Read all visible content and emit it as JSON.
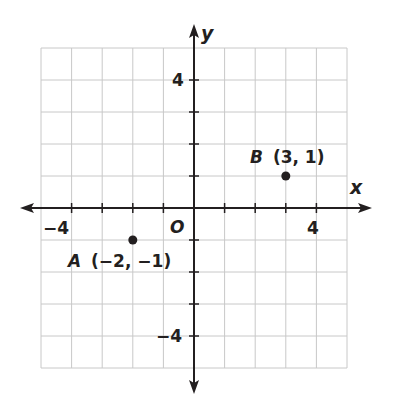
{
  "chart_data": {
    "type": "scatter",
    "title": "",
    "xlabel": "x",
    "ylabel": "y",
    "origin_label": "O",
    "xlim": [
      -5,
      5
    ],
    "ylim": [
      -5,
      5
    ],
    "grid": true,
    "x_tick_labels": [
      {
        "value": -4,
        "label": "−4"
      },
      {
        "value": 4,
        "label": "4"
      }
    ],
    "y_tick_labels": [
      {
        "value": 4,
        "label": "4"
      },
      {
        "value": -4,
        "label": "−4"
      }
    ],
    "points": [
      {
        "name": "A",
        "x": -2,
        "y": -1,
        "label": "A",
        "coords_label": "(−2, −1)"
      },
      {
        "name": "B",
        "x": 3,
        "y": 1,
        "label": "B",
        "coords_label": "(3, 1)"
      }
    ],
    "colors": {
      "grid": "#c8c8c8",
      "axis": "#231f20",
      "point": "#231f20",
      "background": "#ffffff"
    }
  }
}
